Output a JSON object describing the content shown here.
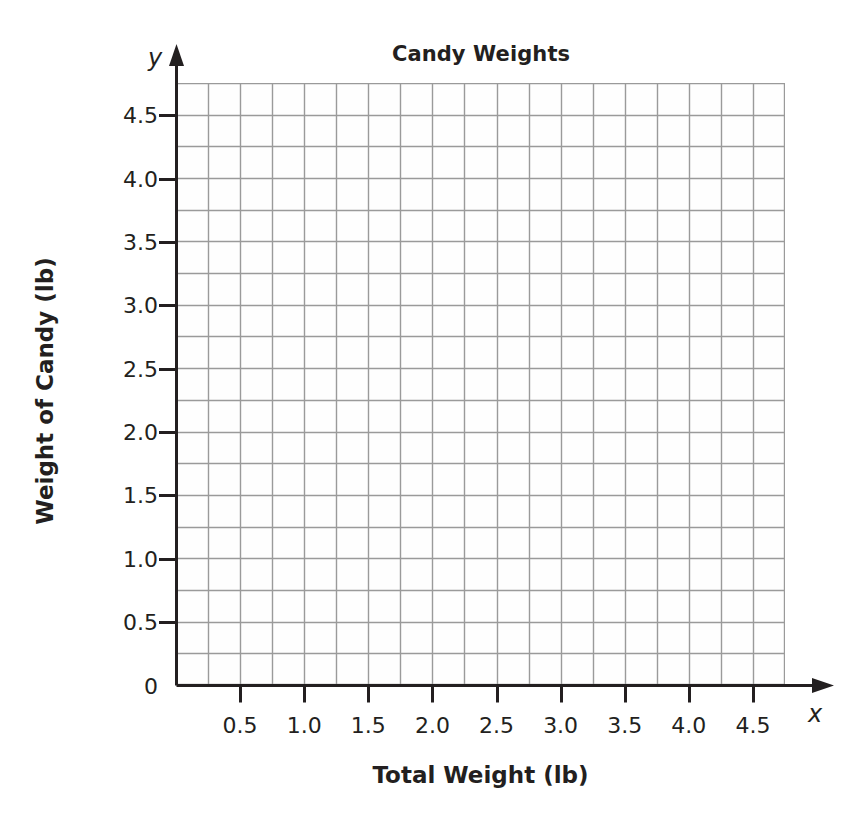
{
  "chart_data": {
    "type": "scatter",
    "title": "Candy Weights",
    "xlabel": "Total Weight (lb)",
    "ylabel": "Weight of Candy (lb)",
    "x_axis_variable": "x",
    "y_axis_variable": "y",
    "xlim": [
      0,
      4.75
    ],
    "ylim": [
      0,
      4.75
    ],
    "x_major_ticks": [
      0.5,
      1.0,
      1.5,
      2.0,
      2.5,
      3.0,
      3.5,
      4.0,
      4.5
    ],
    "x_tick_labels": [
      "0.5",
      "1.0",
      "1.5",
      "2.0",
      "2.5",
      "3.0",
      "3.5",
      "4.0",
      "4.5"
    ],
    "y_major_ticks": [
      0,
      0.5,
      1.0,
      1.5,
      2.0,
      2.5,
      3.0,
      3.5,
      4.0,
      4.5
    ],
    "y_tick_labels": [
      "0",
      "0.5",
      "1.0",
      "1.5",
      "2.0",
      "2.5",
      "3.0",
      "3.5",
      "4.0",
      "4.5"
    ],
    "grid": true,
    "grid_step": 0.25,
    "grid_columns": 19,
    "grid_rows": 19,
    "legend": null,
    "series": [],
    "values": [],
    "annotations": [],
    "colors": {
      "grid_line": "#9a9a9a",
      "axis_line": "#231f20",
      "text": "#231f20",
      "plot_background": "#fefefe",
      "page_background": "#ffffff"
    }
  }
}
